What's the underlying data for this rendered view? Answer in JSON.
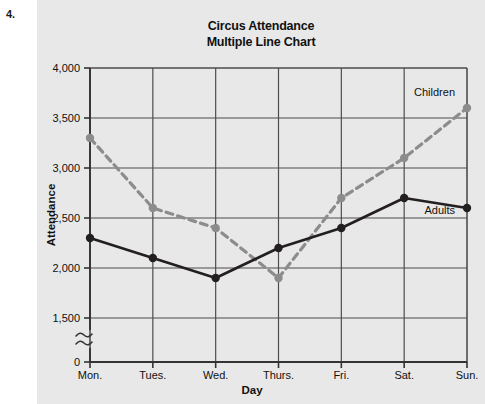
{
  "page": {
    "problem_number": "4.",
    "panel_bg": "#e8e8e8",
    "page_bg": "#ffffff"
  },
  "chart_data": {
    "type": "line",
    "title": "Circus Attendance",
    "subtitle": "Multiple Line Chart",
    "xlabel": "Day",
    "ylabel": "Attendance",
    "categories": [
      "Mon.",
      "Tues.",
      "Wed.",
      "Thurs.",
      "Fri.",
      "Sat.",
      "Sun."
    ],
    "series": [
      {
        "name": "Children",
        "values": [
          3300,
          2600,
          2400,
          1900,
          2700,
          3100,
          3600
        ],
        "color": "#8c8c8c",
        "style": "dashed",
        "marker": "circle"
      },
      {
        "name": "Adults",
        "values": [
          2300,
          2100,
          1900,
          2200,
          2400,
          2700,
          2600
        ],
        "color": "#231f20",
        "style": "solid",
        "marker": "circle"
      }
    ],
    "ylim": [
      1500,
      4000
    ],
    "y_ticks": [
      "0",
      "1,500",
      "2,000",
      "2,500",
      "3,000",
      "3,500",
      "4,000"
    ],
    "y_tick_values": [
      0,
      1500,
      2000,
      2500,
      3000,
      3500,
      4000
    ],
    "axis_break": true,
    "axis_break_symbol": "≈",
    "grid": true,
    "legend": "inline-labels",
    "annotations": [
      {
        "text": "Children",
        "series": "Children"
      },
      {
        "text": "Adults",
        "series": "Adults"
      }
    ]
  }
}
